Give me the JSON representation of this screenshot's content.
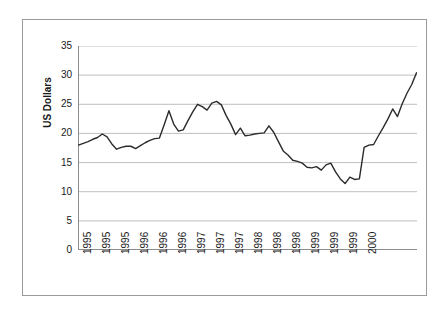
{
  "chart_data": {
    "type": "line",
    "title": "",
    "subtitle": "",
    "xlabel": "",
    "ylabel": "US Dollars",
    "ylim": [
      0,
      35
    ],
    "y_ticks": [
      0,
      5,
      10,
      15,
      20,
      25,
      30,
      35
    ],
    "y_tick_labels": [
      "0",
      "5",
      "10",
      "15",
      "20",
      "25",
      "30",
      "35"
    ],
    "grid": "horizontal",
    "legend": "none",
    "series_color": "#2b2b2b",
    "axis_color": "#8c8c8c",
    "gridline_color": "#bfbfbf",
    "frame_color": "#9a9a9a",
    "x_tick_labels": [
      "1995",
      "1995",
      "1995",
      "1996",
      "1996",
      "1996",
      "1997",
      "1997",
      "1997",
      "1998",
      "1998",
      "1998",
      "1999",
      "1999",
      "1999",
      "2000"
    ],
    "x_label_interval": 4,
    "n_points": 65,
    "x": [
      "1995-01",
      "1995-02",
      "1995-03",
      "1995-04",
      "1995-05",
      "1995-06",
      "1995-07",
      "1995-08",
      "1995-09",
      "1995-10",
      "1995-11",
      "1995-12",
      "1996-01",
      "1996-02",
      "1996-03",
      "1996-04",
      "1996-05",
      "1996-06",
      "1996-07",
      "1996-08",
      "1996-09",
      "1996-10",
      "1996-11",
      "1996-12",
      "1997-01",
      "1997-02",
      "1997-03",
      "1997-04",
      "1997-05",
      "1997-06",
      "1997-07",
      "1997-08",
      "1997-09",
      "1997-10",
      "1997-11",
      "1997-12",
      "1998-01",
      "1998-02",
      "1998-03",
      "1998-04",
      "1998-05",
      "1998-06",
      "1998-07",
      "1998-08",
      "1998-09",
      "1998-10",
      "1998-11",
      "1998-12",
      "1999-01",
      "1999-02",
      "1999-03",
      "1999-04",
      "1999-05",
      "1999-06",
      "1999-07",
      "1999-08",
      "1999-09",
      "1999-10",
      "1999-11",
      "1999-12",
      "2000-01",
      "2000-02",
      "2000-03",
      "2000-04",
      "2000-05"
    ],
    "values": [
      18.0,
      18.3,
      18.6,
      19.0,
      19.3,
      19.9,
      19.4,
      18.2,
      17.3,
      17.6,
      17.8,
      17.8,
      17.4,
      17.9,
      18.4,
      18.8,
      19.1,
      19.2,
      21.5,
      23.9,
      21.6,
      20.4,
      20.6,
      22.2,
      23.7,
      25.0,
      24.6,
      24.0,
      25.2,
      25.5,
      24.9,
      23.1,
      21.6,
      19.8,
      20.9,
      19.6,
      19.7,
      19.9,
      20.0,
      20.1,
      21.3,
      20.2,
      18.6,
      17.0,
      16.3,
      15.4,
      15.2,
      14.9,
      14.2,
      14.1,
      14.3,
      13.7,
      14.6,
      14.9,
      13.4,
      12.2,
      11.4,
      12.5,
      12.1,
      12.2,
      17.6,
      18.0,
      18.1,
      19.6,
      21.0
    ],
    "values_tail": [
      22.5,
      24.2,
      22.9,
      25.1,
      26.9,
      28.4,
      30.4
    ],
    "annotations": [],
    "data_min": 11.4,
    "data_max": 30.4
  },
  "axis": {
    "y_title": "US Dollars"
  }
}
